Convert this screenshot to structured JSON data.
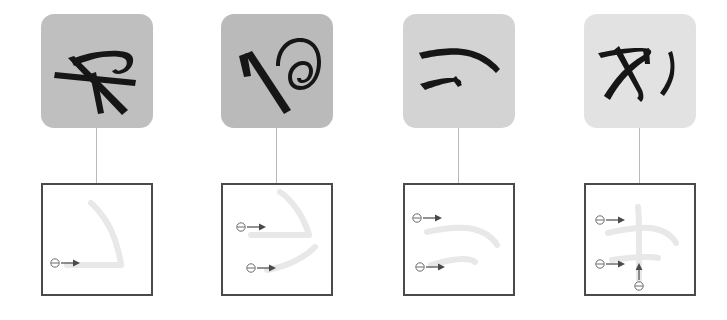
{
  "figure": {
    "type": "handwriting-stroke-decomposition",
    "canvas": {
      "width": 727,
      "height": 320,
      "background": "#ffffff"
    },
    "panel_count": 4,
    "row_labels": {
      "top_row": "handwritten character sample",
      "bottom_row": "stroke trajectory diagram"
    },
    "marker_legend": {
      "start_marker": "circle-with-horizontal-bar",
      "direction_marker": "arrow"
    },
    "colors": {
      "ink": "#161616",
      "ghost_stroke": "#e8e8e8",
      "box_border": "#4a4a4a",
      "connector": "#b9b9b9",
      "marker": "#5a5a5a",
      "page_background": "#ffffff"
    },
    "panels": [
      {
        "index": 1,
        "panel_name": "panel-1",
        "card_background": "#bfbfbf",
        "card_label": "sample-card-1",
        "box_label": "stroke-box-1",
        "stroke_count": 1,
        "strokes": [
          {
            "id": "stroke-1-1",
            "name": "horizontal-to-rising-hook",
            "start_marker_x": 12,
            "start_marker_y": 78,
            "arrow_dx": 16
          }
        ]
      },
      {
        "index": 2,
        "panel_name": "panel-2",
        "card_background": "#bababa",
        "card_label": "sample-card-2",
        "box_label": "stroke-box-2",
        "stroke_count": 2,
        "strokes": [
          {
            "id": "stroke-2-1",
            "name": "upper-angled-sweep",
            "start_marker_x": 18,
            "start_marker_y": 42,
            "arrow_dx": 16
          },
          {
            "id": "stroke-2-2",
            "name": "lower-curved-sweep",
            "start_marker_x": 28,
            "start_marker_y": 83,
            "arrow_dx": 16
          }
        ]
      },
      {
        "index": 3,
        "panel_name": "panel-3",
        "card_background": "#d3d3d3",
        "card_label": "sample-card-3",
        "box_label": "stroke-box-3",
        "stroke_count": 2,
        "strokes": [
          {
            "id": "stroke-3-1",
            "name": "upper-long-arc",
            "start_marker_x": 12,
            "start_marker_y": 33,
            "arrow_dx": 16
          },
          {
            "id": "stroke-3-2",
            "name": "lower-short-arc",
            "start_marker_x": 15,
            "start_marker_y": 82,
            "arrow_dx": 16
          }
        ]
      },
      {
        "index": 4,
        "panel_name": "panel-4",
        "card_background": "#e2e2e2",
        "card_label": "sample-card-4",
        "box_label": "stroke-box-4",
        "stroke_count": 3,
        "strokes": [
          {
            "id": "stroke-4-1",
            "name": "horizontal-arc",
            "start_marker_x": 14,
            "start_marker_y": 35,
            "arrow_dx": 16
          },
          {
            "id": "stroke-4-2",
            "name": "second-horizontal",
            "start_marker_x": 14,
            "start_marker_y": 79,
            "arrow_dx": 16
          },
          {
            "id": "stroke-4-3",
            "name": "vertical-upward",
            "start_marker_x": 53,
            "start_marker_y": 100,
            "arrow_dy": -16
          }
        ]
      }
    ]
  }
}
